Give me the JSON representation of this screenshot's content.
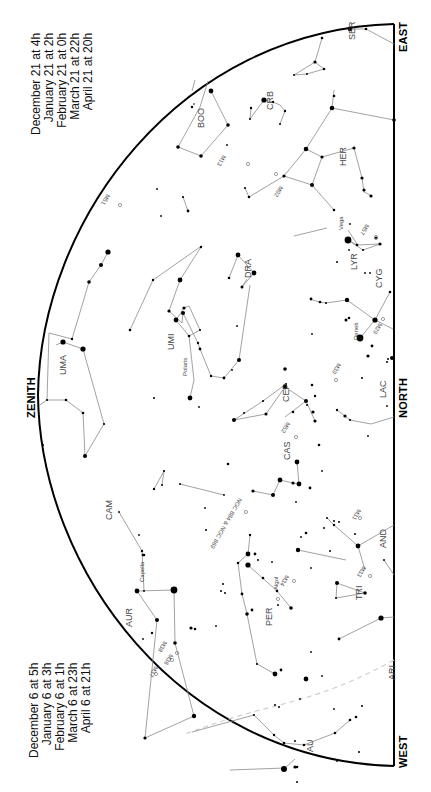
{
  "chart_data": {
    "type": "star_chart",
    "orientation": "rotated 90 degrees clockwise; horizon on the right, zenith on the left",
    "directions": {
      "zenith": "ZENITH",
      "north": "NORTH",
      "east": "EAST",
      "west": "WEST"
    },
    "times_east": [
      "December 21 at   4h",
      "January 21 at   2h",
      "February 21 at   0h",
      "March 21 at 22h",
      "April 21 at 20h"
    ],
    "times_west": [
      "December 6 at   5h",
      "January 6 at   3h",
      "February 6 at   1h",
      "March 6 at 23h",
      "April 6 at 21h"
    ],
    "constellations": [
      "SER",
      "CRB",
      "BOO",
      "HER",
      "LYR",
      "CYG",
      "DRA",
      "UMI",
      "UMA",
      "CEP",
      "LAC",
      "CAS",
      "CAM",
      "AND",
      "TRI",
      "PER",
      "AUR",
      "ARI",
      "AU"
    ],
    "star_labels": [
      "Vega",
      "Deneb",
      "Polaris",
      "Capella",
      "Algol"
    ],
    "deep_sky_objects": [
      "M13",
      "M92",
      "M51",
      "M57",
      "M39",
      "M52",
      "M29",
      "NGC 884 & NGC 869",
      "M34",
      "M31",
      "M33",
      "M38",
      "M36",
      "M37"
    ]
  },
  "labels": {
    "zenith": "ZENITH",
    "north": "NORTH",
    "east": "EAST",
    "west": "WEST"
  },
  "times_east": [
    "December 21 at   4h",
    "January 21 at   2h",
    "February 21 at   0h",
    "March 21 at 22h",
    "April 21 at 20h"
  ],
  "times_west": [
    "December 6 at   5h",
    "January 6 at   3h",
    "February 6 at   1h",
    "March 6 at 23h",
    "April 6 at 21h"
  ],
  "constellation_labels": [
    {
      "text": "SER",
      "x": 347,
      "y": 40
    },
    {
      "text": "CRB",
      "x": 265,
      "y": 110
    },
    {
      "text": "BOO",
      "x": 196,
      "y": 128
    },
    {
      "text": "HER",
      "x": 338,
      "y": 166
    },
    {
      "text": "LYR",
      "x": 349,
      "y": 270
    },
    {
      "text": "CYG",
      "x": 374,
      "y": 288
    },
    {
      "text": "DRA",
      "x": 243,
      "y": 278
    },
    {
      "text": "UMI",
      "x": 166,
      "y": 350
    },
    {
      "text": "UMA",
      "x": 58,
      "y": 375
    },
    {
      "text": "CEP",
      "x": 281,
      "y": 402
    },
    {
      "text": "LAC",
      "x": 378,
      "y": 398
    },
    {
      "text": "CAS",
      "x": 282,
      "y": 460
    },
    {
      "text": "CAM",
      "x": 104,
      "y": 520
    },
    {
      "text": "AND",
      "x": 378,
      "y": 548
    },
    {
      "text": "TRI",
      "x": 354,
      "y": 600
    },
    {
      "text": "PER",
      "x": 264,
      "y": 626
    },
    {
      "text": "AUR",
      "x": 124,
      "y": 627
    },
    {
      "text": "ARI",
      "x": 387,
      "y": 680
    },
    {
      "text": "AU",
      "x": 305,
      "y": 752
    }
  ],
  "star_labels": [
    {
      "text": "Vega",
      "x": 338,
      "y": 230
    },
    {
      "text": "Deneb",
      "x": 353,
      "y": 340
    },
    {
      "text": "Polaris",
      "x": 182,
      "y": 376
    },
    {
      "text": "Capella",
      "x": 139,
      "y": 582
    },
    {
      "text": "Algol",
      "x": 273,
      "y": 590
    }
  ],
  "object_labels": [
    {
      "text": "M13",
      "x": 227,
      "y": 157
    },
    {
      "text": "M92",
      "x": 284,
      "y": 188
    },
    {
      "text": "M51",
      "x": 111,
      "y": 196
    },
    {
      "text": "M57",
      "x": 370,
      "y": 226
    },
    {
      "text": "M29",
      "x": 383,
      "y": 325
    },
    {
      "text": "M39",
      "x": 342,
      "y": 365
    },
    {
      "text": "M52",
      "x": 291,
      "y": 424
    },
    {
      "text": "NGC 884 & NGC 869",
      "x": 243,
      "y": 500
    },
    {
      "text": "M34",
      "x": 290,
      "y": 577
    },
    {
      "text": "M31",
      "x": 362,
      "y": 511
    },
    {
      "text": "M33",
      "x": 367,
      "y": 568
    },
    {
      "text": "M38",
      "x": 168,
      "y": 643
    },
    {
      "text": "M36",
      "x": 174,
      "y": 656
    },
    {
      "text": "M37",
      "x": 159,
      "y": 668
    }
  ],
  "colors": {
    "border": "#000000",
    "lines": "#8a8a8a",
    "stars": "#000000",
    "ecliptic": "#c8c8c8",
    "text": "#111111"
  }
}
